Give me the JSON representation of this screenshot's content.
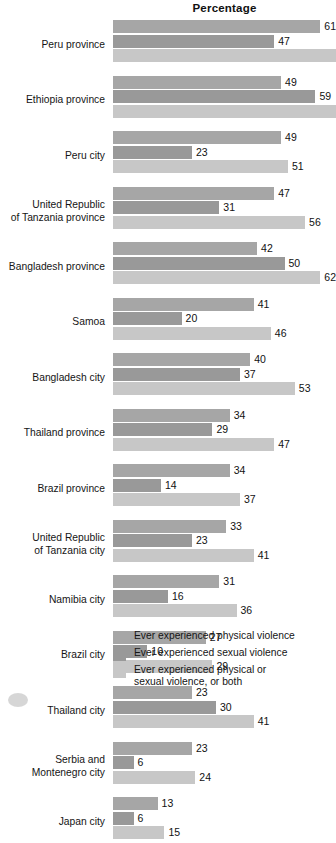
{
  "chart_data": {
    "type": "bar",
    "title": "Percentage",
    "xlabel": "",
    "ylabel": "",
    "orientation": "horizontal",
    "grouped": true,
    "grid": false,
    "legend_position": "bottom",
    "xlim": [
      0,
      65
    ],
    "categories": [
      "Peru province",
      "Ethiopia province",
      "Peru city",
      "United Republic\nof Tanzania province",
      "Bangladesh province",
      "Samoa",
      "Bangladesh city",
      "Thailand province",
      "Brazil province",
      "United Republic\nof Tanzania city",
      "Namibia city",
      "Brazil city",
      "Thailand city",
      "Serbia and\nMontenegro city",
      "Japan city"
    ],
    "series": [
      {
        "name": "Ever experienced physical violence",
        "color": "#a6a6a6",
        "values": [
          61,
          49,
          49,
          47,
          42,
          41,
          40,
          34,
          34,
          33,
          31,
          27,
          23,
          23,
          13
        ]
      },
      {
        "name": "Ever experienced sexual violence",
        "color": "#999999",
        "values": [
          47,
          59,
          23,
          31,
          50,
          20,
          37,
          29,
          14,
          23,
          16,
          10,
          30,
          6,
          6
        ]
      },
      {
        "name": "Ever experienced physical or\nsexual violence, or both",
        "color": "#c7c7c7",
        "values": [
          69,
          71,
          51,
          56,
          62,
          46,
          53,
          47,
          37,
          41,
          36,
          29,
          41,
          24,
          15
        ]
      }
    ],
    "value_labels": [
      {
        "category": "Peru province",
        "labels": [
          "61",
          "47",
          ""
        ]
      },
      {
        "category": "Ethiopia province",
        "labels": [
          "49",
          "59",
          ""
        ]
      },
      {
        "category": "Peru city",
        "labels": [
          "49",
          "23",
          "51"
        ]
      },
      {
        "category": "United Republic of Tanzania province",
        "labels": [
          "47",
          "31",
          "56"
        ]
      },
      {
        "category": "Bangladesh province",
        "labels": [
          "42",
          "50",
          "62"
        ]
      },
      {
        "category": "Samoa",
        "labels": [
          "41",
          "20",
          "46"
        ]
      },
      {
        "category": "Bangladesh city",
        "labels": [
          "40",
          "37",
          "53"
        ]
      },
      {
        "category": "Thailand province",
        "labels": [
          "34",
          "29",
          "47"
        ]
      },
      {
        "category": "Brazil province",
        "labels": [
          "34",
          "14",
          "37"
        ]
      },
      {
        "category": "United Republic of Tanzania city",
        "labels": [
          "33",
          "23",
          "41"
        ]
      },
      {
        "category": "Namibia city",
        "labels": [
          "31",
          "16",
          "36"
        ]
      },
      {
        "category": "Brazil city",
        "labels": [
          "27",
          "10",
          "29"
        ]
      },
      {
        "category": "Thailand city",
        "labels": [
          "23",
          "30",
          "41"
        ]
      },
      {
        "category": "Serbia and Montenegro city",
        "labels": [
          "23",
          "6",
          "24"
        ]
      },
      {
        "category": "Japan city",
        "labels": [
          "13",
          "6",
          "15"
        ]
      }
    ]
  },
  "legend": {
    "items": [
      {
        "label": "Ever experienced physical violence",
        "swatch": "s0"
      },
      {
        "label": "Ever experienced sexual violence",
        "swatch": "s1"
      },
      {
        "label": "Ever experienced physical or\nsexual violence, or both",
        "swatch": "s2"
      }
    ]
  }
}
